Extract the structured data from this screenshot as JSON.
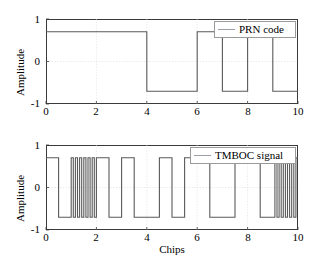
{
  "figure": {
    "width": 310,
    "height": 260,
    "background": "#ffffff"
  },
  "style": {
    "trace_color": "#595959",
    "axis_color": "#3a3a3a",
    "grid_color": "#d9d9d9",
    "legend_border": "#9a9a9a",
    "legend_line_color": "#9aa0a6"
  },
  "panels": [
    {
      "id": "prn",
      "ylabel": "Amplitude",
      "xlabel": "",
      "yticks": [
        "1",
        "0",
        "-1"
      ],
      "xticks": [
        "0",
        "2",
        "4",
        "6",
        "8",
        "10"
      ],
      "legend": {
        "label": "PRN code",
        "marker": "line-sample"
      }
    },
    {
      "id": "tmboc",
      "ylabel": "Amplitude",
      "xlabel": "Chips",
      "yticks": [
        "1",
        "0",
        "-1"
      ],
      "xticks": [
        "0",
        "2",
        "4",
        "6",
        "8",
        "10"
      ],
      "legend": {
        "label": "TMBOC signal",
        "marker": "line-sample"
      }
    }
  ],
  "chart_data": [
    {
      "type": "line",
      "id": "prn-code",
      "title": "",
      "xlabel": "",
      "ylabel": "Amplitude",
      "xlim": [
        0,
        10
      ],
      "ylim": [
        -1,
        1
      ],
      "xticks": [
        0,
        2,
        4,
        6,
        8,
        10
      ],
      "yticks": [
        -1,
        0,
        1
      ],
      "grid": true,
      "legend": "PRN code",
      "legend_position": "top-right",
      "amplitude_high": 0.7,
      "amplitude_low": -0.7,
      "description": "Square wave PRN chip sequence, one sample per chip, levels +/-0.7",
      "chip_values": [
        1,
        1,
        1,
        1,
        -1,
        -1,
        1,
        -1,
        1,
        -1
      ],
      "series": [
        {
          "name": "PRN code",
          "waveform_segments": [
            {
              "x_start": 0,
              "x_end": 4,
              "y": 0.7
            },
            {
              "x_start": 4,
              "x_end": 6,
              "y": -0.7
            },
            {
              "x_start": 6,
              "x_end": 7,
              "y": 0.7
            },
            {
              "x_start": 7,
              "x_end": 8,
              "y": -0.7
            },
            {
              "x_start": 8,
              "x_end": 9,
              "y": 0.7
            },
            {
              "x_start": 9,
              "x_end": 10,
              "y": -0.7
            }
          ]
        }
      ]
    },
    {
      "type": "line",
      "id": "tmboc-signal",
      "title": "",
      "xlabel": "Chips",
      "ylabel": "Amplitude",
      "xlim": [
        0,
        10
      ],
      "ylim": [
        -1,
        1
      ],
      "xticks": [
        0,
        2,
        4,
        6,
        8,
        10
      ],
      "yticks": [
        -1,
        0,
        1
      ],
      "grid": true,
      "legend": "TMBOC signal",
      "legend_position": "top-right",
      "amplitude_high": 0.7,
      "amplitude_low": -0.7,
      "description": "TMBOC: PRN code multiplied by BOC(1,1) subcarrier (2 half-chip flips per chip), with BOC(6,1) bursts (12 flips per chip) on chips 1-2 and 9-10",
      "chip_values": [
        1,
        1,
        1,
        1,
        -1,
        -1,
        1,
        -1,
        1,
        -1
      ],
      "boc61_chips": [
        1,
        9
      ],
      "boc11_flips_per_chip": 2,
      "boc61_flips_per_chip": 12,
      "series": [
        {
          "name": "TMBOC signal",
          "subcarrier_start_sign": 1
        }
      ]
    }
  ]
}
